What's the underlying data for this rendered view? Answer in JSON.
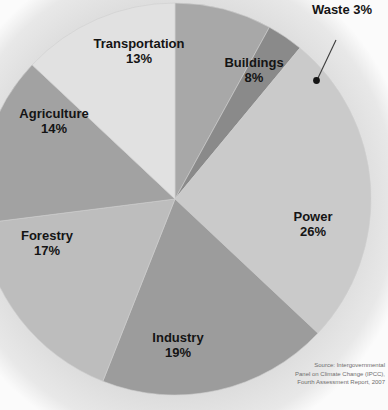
{
  "chart_data": {
    "type": "pie",
    "title": "",
    "categories": [
      "Buildings",
      "Waste",
      "Power",
      "Industry",
      "Forestry",
      "Agriculture",
      "Transportation"
    ],
    "values": [
      8,
      3,
      26,
      19,
      17,
      14,
      13
    ],
    "unit": "%",
    "total": 100,
    "start_angle_deg": 0,
    "direction": "clockwise",
    "legend": "none",
    "grid": false,
    "slices": [
      {
        "label": "Buildings",
        "value": 8,
        "display": "8%",
        "color": "#a8a8a8",
        "label_position": "inside"
      },
      {
        "label": "Waste",
        "value": 3,
        "display": "3%",
        "color": "#8a8a8a",
        "label_position": "callout"
      },
      {
        "label": "Power",
        "value": 26,
        "display": "26%",
        "color": "#cacaca",
        "label_position": "inside"
      },
      {
        "label": "Industry",
        "value": 19,
        "display": "19%",
        "color": "#9c9c9c",
        "label_position": "inside"
      },
      {
        "label": "Forestry",
        "value": 17,
        "display": "17%",
        "color": "#bdbdbd",
        "label_position": "inside"
      },
      {
        "label": "Agriculture",
        "value": 14,
        "display": "14%",
        "color": "#a2a2a2",
        "label_position": "inside"
      },
      {
        "label": "Transportation",
        "value": 13,
        "display": "13%",
        "color": "#e1e1e1",
        "label_position": "inside"
      }
    ],
    "source": {
      "line1": "Source: Intergovernmental",
      "line2": "Panel on Climate Change (IPCC),",
      "line3": "Fourth Assessment Report, 2007"
    }
  },
  "labels": {
    "transportation": {
      "name": "Transportation",
      "pct": "13%"
    },
    "buildings": {
      "name": "Buildings",
      "pct": "8%"
    },
    "waste": {
      "name": "Waste",
      "pct": "3%"
    },
    "power": {
      "name": "Power",
      "pct": "26%"
    },
    "industry": {
      "name": "Industry",
      "pct": "19%"
    },
    "forestry": {
      "name": "Forestry",
      "pct": "17%"
    },
    "agriculture": {
      "name": "Agriculture",
      "pct": "14%"
    }
  },
  "page_text": {
    "carbon": "arbon",
    "of": "of",
    "r": "r",
    "react": "react",
    "form": "to  form"
  },
  "colors": {
    "page_background": "#fefefe",
    "chart_backdrop": "#d8d8d8",
    "label_text": "#141414",
    "source_text": "#6e6e6e",
    "callout_line": "#3c3c3c"
  }
}
